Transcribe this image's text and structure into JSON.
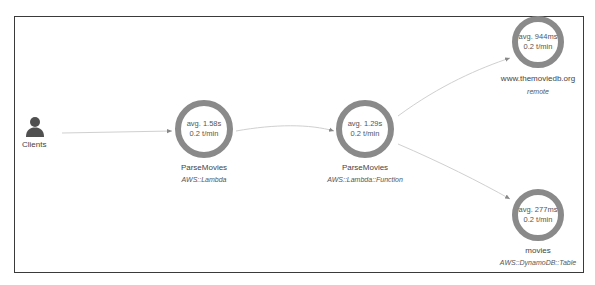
{
  "diagram": {
    "type": "service-map",
    "colors": {
      "ring": "#8a8a8a",
      "edge": "#d0d0d0",
      "border": "#3a3a3a",
      "client_icon": "#505050"
    },
    "client": {
      "label": "Clients",
      "icon": "person-icon"
    },
    "nodes": [
      {
        "id": "lambda",
        "avg": "avg. 1.58s",
        "rate": "0.2 t/min",
        "name": "ParseMovies",
        "type": "AWS::Lambda"
      },
      {
        "id": "function",
        "avg": "avg. 1.29s",
        "rate": "0.2 t/min",
        "name": "ParseMovies",
        "type": "AWS::Lambda::Function"
      },
      {
        "id": "remote",
        "avg": "avg. 944ms",
        "rate": "0.2 t/min",
        "name": "www.themoviedb.org",
        "type": "remote"
      },
      {
        "id": "dynamo",
        "avg": "avg. 277ms",
        "rate": "0.2 t/min",
        "name": "movies",
        "type": "AWS::DynamoDB::Table"
      }
    ],
    "edges": [
      {
        "from": "Clients",
        "to": "lambda"
      },
      {
        "from": "lambda",
        "to": "function"
      },
      {
        "from": "function",
        "to": "remote"
      },
      {
        "from": "function",
        "to": "dynamo"
      }
    ]
  }
}
